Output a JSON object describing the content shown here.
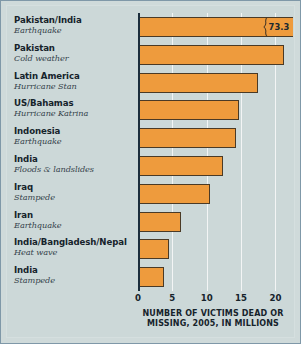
{
  "chart_data": {
    "type": "bar",
    "orientation": "horizontal",
    "title": "",
    "xlabel": "NUMBER OF VICTIMS DEAD OR MISSING, 2005, IN MILLIONS",
    "ylabel": "",
    "xlim": [
      0,
      23
    ],
    "xticks": [
      0,
      5,
      10,
      15,
      20
    ],
    "xtick_labels": [
      "0",
      "5",
      "10",
      "15",
      "20"
    ],
    "grid": true,
    "legend": false,
    "bar_color": "#ee9b3d",
    "bar_border_color": "#4a3a26",
    "background_color": "#ccd8d8",
    "axis_color": "#1b2d3c",
    "gridline_color": "#f4f7f7",
    "note": "Top bar is drawn with a broken-axis zigzag; its true value 73.3 exceeds the axis range.",
    "categories": [
      "Pakistan/India",
      "Pakistan",
      "Latin America",
      "US/Bahamas",
      "Indonesia",
      "India",
      "Iraq",
      "Iran",
      "India/Bangladesh/Nepal",
      "India"
    ],
    "values": [
      73.3,
      21.3,
      17.5,
      14.7,
      14.3,
      12.4,
      10.5,
      6.3,
      4.5,
      3.8
    ],
    "items": [
      {
        "place": "Pakistan/India",
        "cause": "Earthquake",
        "value": 73.3,
        "drawn_value": 22.6,
        "broken": true,
        "value_label": "73.3"
      },
      {
        "place": "Pakistan",
        "cause": "Cold weather",
        "value": 21.3,
        "drawn_value": 21.3,
        "broken": false,
        "value_label": ""
      },
      {
        "place": "Latin America",
        "cause": "Hurricane Stan",
        "value": 17.5,
        "drawn_value": 17.5,
        "broken": false,
        "value_label": ""
      },
      {
        "place": "US/Bahamas",
        "cause": "Hurricane Katrina",
        "value": 14.7,
        "drawn_value": 14.7,
        "broken": false,
        "value_label": ""
      },
      {
        "place": "Indonesia",
        "cause": "Earthquake",
        "value": 14.3,
        "drawn_value": 14.3,
        "broken": false,
        "value_label": ""
      },
      {
        "place": "India",
        "cause": "Floods & landslides",
        "value": 12.4,
        "drawn_value": 12.4,
        "broken": false,
        "value_label": ""
      },
      {
        "place": "Iraq",
        "cause": "Stampede",
        "value": 10.5,
        "drawn_value": 10.5,
        "broken": false,
        "value_label": ""
      },
      {
        "place": "Iran",
        "cause": "Earthquake",
        "value": 6.3,
        "drawn_value": 6.3,
        "broken": false,
        "value_label": ""
      },
      {
        "place": "India/Bangladesh/Nepal",
        "cause": "Heat wave",
        "value": 4.5,
        "drawn_value": 4.5,
        "broken": false,
        "value_label": ""
      },
      {
        "place": "India",
        "cause": "Stampede",
        "value": 3.8,
        "drawn_value": 3.8,
        "broken": false,
        "value_label": ""
      }
    ]
  },
  "caption": {
    "line1": "NUMBER OF VICTIMS DEAD OR",
    "line2": "MISSING, 2005, IN MILLIONS"
  }
}
